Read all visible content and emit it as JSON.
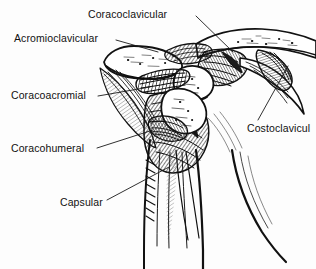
{
  "figure": {
    "style": "black-and-white line engraving / hatched medical illustration",
    "width": 316,
    "height": 269,
    "background_color": "#fdfdfd",
    "ink_color": "#111111"
  },
  "labels": [
    {
      "id": "coracoclavicular",
      "text": "Coracoclavicular",
      "x": 88,
      "y": 8,
      "leader_from": [
        196,
        16
      ],
      "leader_to": [
        233,
        52
      ]
    },
    {
      "id": "acromioclavicular",
      "text": "Acromioclavicular",
      "x": 14,
      "y": 32,
      "leader_from": [
        116,
        40
      ],
      "leader_to": [
        156,
        51
      ]
    },
    {
      "id": "coracoacromial",
      "text": "Coracoacromial",
      "x": 11,
      "y": 89,
      "leader_from": [
        98,
        96
      ],
      "leader_to": [
        148,
        88
      ]
    },
    {
      "id": "coracohumeral",
      "text": "Coracohumeral",
      "x": 11,
      "y": 142,
      "leader_from": [
        97,
        148
      ],
      "leader_to": [
        152,
        131
      ]
    },
    {
      "id": "capsular",
      "text": "Capsular",
      "x": 60,
      "y": 196,
      "leader_from": [
        107,
        200
      ],
      "leader_to": [
        168,
        168
      ]
    },
    {
      "id": "costoclavicular",
      "text": "Costoclavicul",
      "truncated": true,
      "x": 247,
      "y": 122,
      "leader_from": [
        258,
        120
      ],
      "leader_to": [
        288,
        66
      ]
    }
  ],
  "structures": [
    "clavicle",
    "acromion",
    "coracoid process",
    "scapula",
    "humeral head",
    "humerus shaft",
    "first rib"
  ]
}
